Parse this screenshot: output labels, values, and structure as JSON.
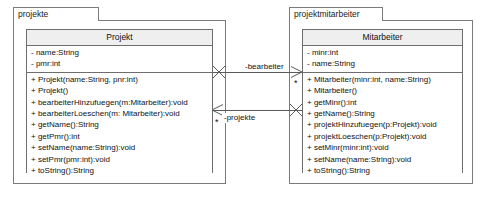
{
  "diagram": {
    "type": "uml-class-diagram",
    "background_color": "#ffffff",
    "line_color": "#5a5a5a",
    "header_fill": "#efefef",
    "border_color": "#6e6e6e"
  },
  "packages": [
    {
      "name": "projekte",
      "class": {
        "name": "Projekt",
        "attributes": [
          "- name:String",
          "- pmr:int"
        ],
        "operations": [
          "+ Projekt(name:String, pnr:int)",
          "+ Projekt()",
          "+ bearbeiterHinzufuegen(m:Mitarbeiter):void",
          "+ bearbeiterLoeschen(m: Mitarbeiter):void",
          "+ getName():String",
          "+ getPmr():int",
          "+ setName(name:String):void",
          "+ setPmr(pmr:int):void",
          "+ toString():String"
        ]
      }
    },
    {
      "name": "projektmitarbeiter",
      "class": {
        "name": "Mitarbeiter",
        "attributes": [
          "- minr:int",
          "- name:String"
        ],
        "operations": [
          "+ Mitarbeiter(minr:int, name:String)",
          "+ Mitarbeiter()",
          "+ getMinr():int",
          "+ getName():String",
          "+ projektHinzufuegen(p:Projekt):void",
          "+ projektLoeschen(p:Projekt):void",
          "+ setMinr(minr:int):void",
          "+ setName(name:String):void",
          "+ toString():String"
        ]
      }
    }
  ],
  "associations": [
    {
      "label": "-bearbeiter",
      "source_multiplicity": "",
      "target_multiplicity": "*",
      "direction": "projekt-to-mitarbeiter"
    },
    {
      "label": "-projekte",
      "source_multiplicity": "*",
      "target_multiplicity": "",
      "direction": "mitarbeiter-to-projekt"
    }
  ]
}
